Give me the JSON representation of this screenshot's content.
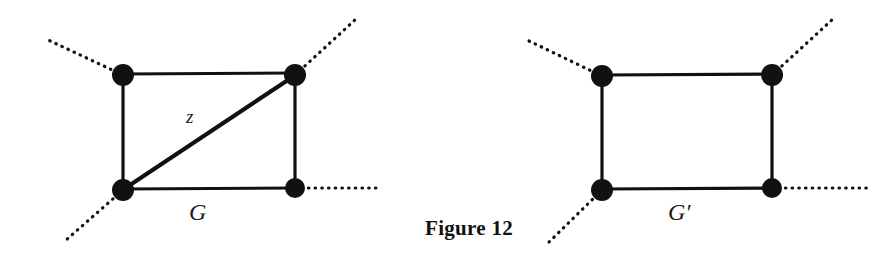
{
  "figure": {
    "caption": "Figure 12",
    "background_color": "#ffffff",
    "ink_color": "#111111",
    "labels": {
      "edge_z": "z",
      "graph_left": "G",
      "graph_right": "G′"
    },
    "graphs": [
      {
        "name": "G",
        "label": "G",
        "label_position": {
          "x": 189,
          "y": 200
        },
        "vertices": [
          {
            "id": "v-top-left",
            "x": 123,
            "y": 75,
            "radius": 11
          },
          {
            "id": "v-top-right",
            "x": 295,
            "y": 75,
            "radius": 11
          },
          {
            "id": "v-bottom-left",
            "x": 123,
            "y": 190,
            "radius": 11
          },
          {
            "id": "v-bottom-right",
            "x": 295,
            "y": 188,
            "radius": 10
          }
        ],
        "solid_edges": [
          {
            "id": "edge-top",
            "from": "v-top-left",
            "to": "v-top-right",
            "x1": 123,
            "y1": 74,
            "x2": 295,
            "y2": 73,
            "width": 3
          },
          {
            "id": "edge-left",
            "from": "v-top-left",
            "to": "v-bottom-left",
            "x1": 123,
            "y1": 75,
            "x2": 123,
            "y2": 190,
            "width": 3
          },
          {
            "id": "edge-right",
            "from": "v-top-right",
            "to": "v-bottom-right",
            "x1": 295,
            "y1": 75,
            "x2": 295,
            "y2": 188,
            "width": 3
          },
          {
            "id": "edge-bottom",
            "from": "v-bottom-left",
            "to": "v-bottom-right",
            "x1": 123,
            "y1": 189,
            "x2": 295,
            "y2": 188,
            "width": 3
          },
          {
            "id": "edge-diagonal-z",
            "from": "v-bottom-left",
            "to": "v-top-right",
            "x1": 124,
            "y1": 189,
            "x2": 294,
            "y2": 76,
            "width": 4,
            "label": "z"
          }
        ],
        "dotted_half_edges": [
          {
            "id": "dotted-top-left",
            "x1": 123,
            "y1": 75,
            "x2": 46,
            "y2": 39
          },
          {
            "id": "dotted-top-right",
            "x1": 295,
            "y1": 75,
            "x2": 356,
            "y2": 19
          },
          {
            "id": "dotted-bottom-left",
            "x1": 123,
            "y1": 190,
            "x2": 65,
            "y2": 241
          },
          {
            "id": "dotted-bottom-right",
            "x1": 295,
            "y1": 188,
            "x2": 377,
            "y2": 188
          }
        ]
      },
      {
        "name": "G'",
        "label": "G′",
        "label_position": {
          "x": 668,
          "y": 200
        },
        "vertices": [
          {
            "id": "v2-top-left",
            "x": 602,
            "y": 76,
            "radius": 11
          },
          {
            "id": "v2-top-right",
            "x": 772,
            "y": 75,
            "radius": 11
          },
          {
            "id": "v2-bottom-left",
            "x": 602,
            "y": 190,
            "radius": 11
          },
          {
            "id": "v2-bottom-right",
            "x": 772,
            "y": 188,
            "radius": 10
          }
        ],
        "solid_edges": [
          {
            "id": "edge2-top",
            "from": "v2-top-left",
            "to": "v2-top-right",
            "x1": 602,
            "y1": 75,
            "x2": 772,
            "y2": 74,
            "width": 3
          },
          {
            "id": "edge2-left",
            "from": "v2-top-left",
            "to": "v2-bottom-left",
            "x1": 602,
            "y1": 76,
            "x2": 602,
            "y2": 190,
            "width": 3
          },
          {
            "id": "edge2-right",
            "from": "v2-top-right",
            "to": "v2-bottom-right",
            "x1": 772,
            "y1": 75,
            "x2": 772,
            "y2": 188,
            "width": 3
          },
          {
            "id": "edge2-bottom",
            "from": "v2-bottom-left",
            "to": "v2-bottom-right",
            "x1": 602,
            "y1": 189,
            "x2": 772,
            "y2": 188,
            "width": 3
          }
        ],
        "dotted_half_edges": [
          {
            "id": "dotted2-top-left",
            "x1": 602,
            "y1": 76,
            "x2": 527,
            "y2": 40
          },
          {
            "id": "dotted2-top-right",
            "x1": 772,
            "y1": 75,
            "x2": 834,
            "y2": 18
          },
          {
            "id": "dotted2-bottom-left",
            "x1": 602,
            "y1": 190,
            "x2": 548,
            "y2": 243
          },
          {
            "id": "dotted2-bottom-right",
            "x1": 772,
            "y1": 188,
            "x2": 871,
            "y2": 188
          }
        ]
      }
    ]
  }
}
